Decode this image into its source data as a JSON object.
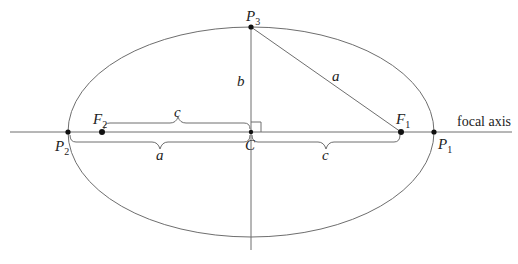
{
  "diagram": {
    "points": {
      "P1": {
        "label": "P",
        "sub": "1"
      },
      "P2": {
        "label": "P",
        "sub": "2"
      },
      "P3": {
        "label": "P",
        "sub": "3"
      },
      "F1": {
        "label": "F",
        "sub": "1"
      },
      "F2": {
        "label": "F",
        "sub": "2"
      },
      "C": {
        "label": "C"
      }
    },
    "segments": {
      "b": "b",
      "a_hyp": "a",
      "c_top": "c",
      "a_bottom": "a",
      "c_bottom": "c"
    },
    "axis_label": "focal axis",
    "colors": {
      "line": "#6e6e6e",
      "point": "#111111",
      "text": "#222222"
    }
  }
}
